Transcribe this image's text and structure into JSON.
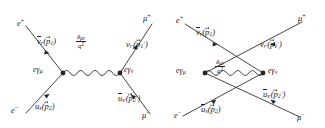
{
  "figure": {
    "background_color": "#ffffff",
    "line_color": "#303030",
    "text_color": "#202020",
    "diagram_count": 2
  },
  "diagrams": [
    {
      "id": "s-channel",
      "name": "s-channel annihilation diagram",
      "topology": "two vertices joined by a horizontal wavy photon propagator",
      "vertices": [
        {
          "name": "left-vertex",
          "label_parts": {
            "coupling": "e",
            "gamma": "γ",
            "index": "μ"
          },
          "label_text": "eγμ"
        },
        {
          "name": "right-vertex",
          "label_parts": {
            "coupling": "e",
            "gamma": "γ",
            "index": "ν"
          },
          "label_text": "eγν"
        }
      ],
      "propagator": {
        "name": "photon-propagator",
        "style": "wavy",
        "numerator": "δμν",
        "denominator_base": "q",
        "denominator_exp": "2",
        "label_text": "δμν / q²"
      },
      "legs": [
        {
          "name": "incoming-positron",
          "position": "upper-left",
          "particle": "e",
          "particle_charge": "+",
          "spinor_symbol": "v",
          "spinor_overline": true,
          "spinor_sub": "r",
          "momentum_symbol": "p",
          "momentum_sub": "1",
          "momentum_prime": false,
          "momentum_vector": true
        },
        {
          "name": "incoming-electron",
          "position": "lower-left",
          "particle": "e",
          "particle_charge": "−",
          "spinor_symbol": "u",
          "spinor_overline": false,
          "spinor_sub": "s",
          "momentum_symbol": "p",
          "momentum_sub": "2",
          "momentum_prime": false,
          "momentum_vector": true
        },
        {
          "name": "outgoing-antimuon",
          "position": "upper-right",
          "particle": "μ",
          "particle_charge": "+",
          "spinor_symbol": "v",
          "spinor_overline": false,
          "spinor_sub": "r′",
          "momentum_symbol": "p",
          "momentum_sub": "1",
          "momentum_prime": true,
          "momentum_vector": true
        },
        {
          "name": "outgoing-muon",
          "position": "lower-right",
          "particle": "μ",
          "particle_charge": "−",
          "spinor_symbol": "u",
          "spinor_overline": true,
          "spinor_sub": "s′",
          "momentum_symbol": "p",
          "momentum_sub": "2",
          "momentum_prime": true,
          "momentum_vector": true
        }
      ]
    },
    {
      "id": "crossed",
      "name": "crossed exchange diagram",
      "topology": "fermion lines cross above the wavy photon propagator joining two vertices",
      "vertices": [
        {
          "name": "left-vertex",
          "label_parts": {
            "coupling": "e",
            "gamma": "γ",
            "index": "μ"
          },
          "label_text": "eγμ"
        },
        {
          "name": "right-vertex",
          "label_parts": {
            "coupling": "e",
            "gamma": "γ",
            "index": "ν"
          },
          "label_text": "eγν"
        }
      ],
      "propagator": {
        "name": "photon-propagator",
        "style": "wavy",
        "numerator": "δμν",
        "denominator_base": "q",
        "denominator_exp": "2",
        "label_text": "δμν / q²"
      },
      "legs": [
        {
          "name": "incoming-positron",
          "position": "upper-left",
          "particle": "e",
          "particle_charge": "+",
          "spinor_symbol": "v",
          "spinor_overline": true,
          "spinor_sub": "r",
          "momentum_symbol": "p",
          "momentum_sub": "1",
          "momentum_prime": false,
          "momentum_vector": true
        },
        {
          "name": "incoming-electron",
          "position": "lower-left",
          "particle": "e",
          "particle_charge": "−",
          "spinor_symbol": "u",
          "spinor_overline": true,
          "spinor_sub": "s",
          "momentum_symbol": "p",
          "momentum_sub": "2",
          "momentum_prime": false,
          "momentum_vector": true
        },
        {
          "name": "outgoing-antimuon",
          "position": "upper-right",
          "particle": "μ",
          "particle_charge": "+",
          "spinor_symbol": "v",
          "spinor_overline": false,
          "spinor_sub": "r′",
          "momentum_symbol": "p",
          "momentum_sub": "1",
          "momentum_prime": true,
          "momentum_vector": true
        },
        {
          "name": "outgoing-muon",
          "position": "lower-right",
          "particle": "μ",
          "particle_charge": "−",
          "spinor_symbol": "u",
          "spinor_overline": true,
          "spinor_sub": "s′",
          "momentum_symbol": "p",
          "momentum_sub": "2",
          "momentum_prime": true,
          "momentum_vector": true
        }
      ]
    }
  ],
  "text": {
    "d1": {
      "e_plus": "e",
      "e_plus_sup": "+",
      "e_minus": "e",
      "e_minus_sup": "−",
      "mu_plus": "μ",
      "mu_plus_sup": "+",
      "mu_minus": "μ",
      "mu_minus_sup": "−",
      "vbar_r": "v",
      "vbar_r_sub": "r",
      "u_s": "u",
      "u_s_sub": "s",
      "v_rp": "v",
      "v_rp_sub": "r",
      "ubar_sp": "u",
      "ubar_sp_sub": "s",
      "p1": "p",
      "p1_sub": "1",
      "p2": "p",
      "p2_sub": "2",
      "p1p": "p",
      "p1p_sub": "1",
      "p2p": "p",
      "p2p_sub": "2",
      "prime": "′",
      "vertex_left_e": "e",
      "vertex_left_g": "γ",
      "vertex_left_i": "μ",
      "vertex_right_e": "e",
      "vertex_right_g": "γ",
      "vertex_right_i": "ν",
      "prop_num_delta": "δ",
      "prop_num_idx": "μν",
      "prop_den_q": "q",
      "prop_den_exp": "2"
    },
    "d2": {
      "e_plus": "e",
      "e_plus_sup": "+",
      "e_minus": "e",
      "e_minus_sup": "−",
      "mu_plus": "μ",
      "mu_plus_sup": "+",
      "mu_minus": "μ",
      "mu_minus_sup": "−",
      "vbar_r": "v",
      "vbar_r_sub": "r",
      "ubar_s": "u",
      "ubar_s_sub": "s",
      "v_rp": "v",
      "v_rp_sub": "r",
      "ubar_sp": "u",
      "ubar_sp_sub": "s",
      "p1": "p",
      "p1_sub": "1",
      "p2": "p",
      "p2_sub": "2",
      "p1p": "p",
      "p1p_sub": "1",
      "p2p": "p",
      "p2p_sub": "2",
      "prime": "′",
      "vertex_left_e": "e",
      "vertex_left_g": "γ",
      "vertex_left_i": "μ",
      "vertex_right_e": "e",
      "vertex_right_g": "γ",
      "vertex_right_i": "ν",
      "prop_num_delta": "δ",
      "prop_num_idx": "μν",
      "prop_den_q": "q",
      "prop_den_exp": "2"
    }
  }
}
